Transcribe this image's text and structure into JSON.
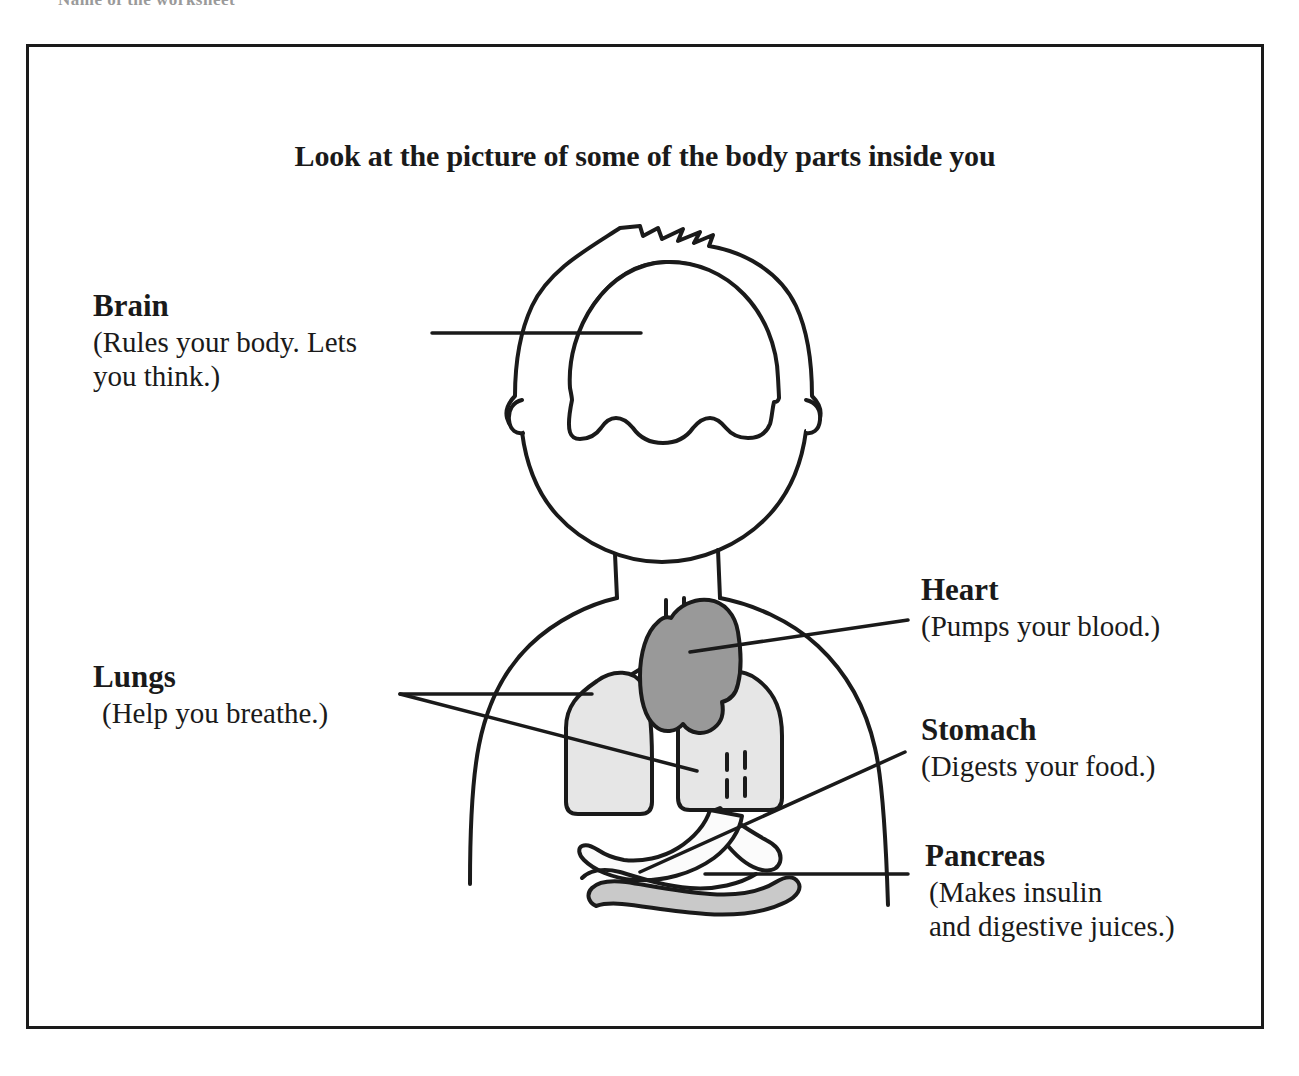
{
  "scan": {
    "top_cut_text": "Name of the worksheet"
  },
  "worksheet": {
    "title": "Look at the picture of some of the body parts inside you",
    "callouts": [
      {
        "id": "brain",
        "name": "Brain",
        "desc_lines": [
          "(Rules your body.  Lets",
          "you think.)"
        ]
      },
      {
        "id": "lungs",
        "name": "Lungs",
        "desc_lines": [
          "(Help you breathe.)"
        ]
      },
      {
        "id": "heart",
        "name": "Heart",
        "desc_lines": [
          "(Pumps your blood.)"
        ]
      },
      {
        "id": "stomach",
        "name": "Stomach",
        "desc_lines": [
          "(Digests your food.)"
        ]
      },
      {
        "id": "pancreas",
        "name": "Pancreas",
        "desc_lines": [
          "(Makes insulin",
          "and digestive juices.)"
        ]
      }
    ]
  },
  "diagram": {
    "organs": [
      {
        "name": "brain",
        "fill": "#ffffff"
      },
      {
        "name": "lung-left",
        "fill": "#e6e6e6"
      },
      {
        "name": "lung-right",
        "fill": "#e6e6e6"
      },
      {
        "name": "heart",
        "fill": "#999999"
      },
      {
        "name": "stomach",
        "fill": "#fbfbfb"
      },
      {
        "name": "pancreas",
        "fill": "#c9c9c9"
      },
      {
        "name": "trachea",
        "fill": "#ffffff"
      }
    ],
    "stroke": "#1a1a1a",
    "leader_line_color": "#1a1a1a"
  }
}
